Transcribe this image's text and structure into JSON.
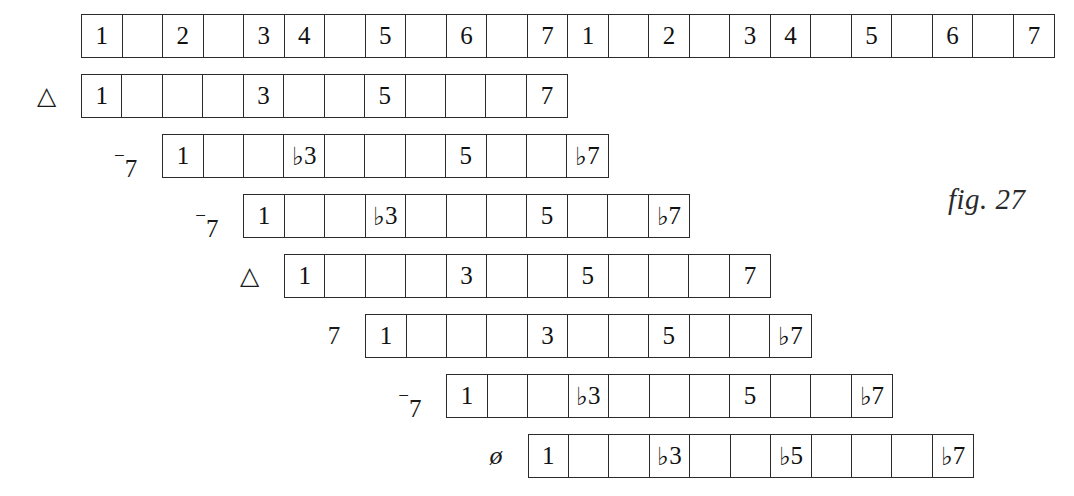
{
  "figure": {
    "caption": "fig. 27",
    "cell_width": 40.6,
    "row_height": 44,
    "origin_x": 81,
    "origin_y": 14,
    "row_pitch": 60
  },
  "chart_data": {
    "type": "table",
    "title": "fig. 27",
    "xlabel": "",
    "ylabel": "",
    "grid": true,
    "legend": "none",
    "cell_count_per_semitone": 1,
    "rows": [
      {
        "name": "chromatic-scale-two-octaves",
        "label": "",
        "label_kind": "none",
        "offset_semitones": 0,
        "cells": 24,
        "degrees": {
          "0": "1",
          "2": "2",
          "4": "3",
          "5": "4",
          "7": "5",
          "9": "6",
          "11": "7",
          "12": "1",
          "14": "2",
          "16": "3",
          "17": "4",
          "19": "5",
          "21": "6",
          "23": "7"
        }
      },
      {
        "name": "major-seventh-on-1",
        "label": "△",
        "label_kind": "triangle",
        "offset_semitones": 0,
        "cells": 12,
        "degrees": {
          "0": "1",
          "4": "3",
          "7": "5",
          "11": "7"
        }
      },
      {
        "name": "minor-seventh-on-2",
        "label": "-7",
        "label_kind": "minor-seven",
        "offset_semitones": 2,
        "cells": 11,
        "degrees": {
          "0": "1",
          "3": "♭3",
          "7": "5",
          "10": "♭7"
        }
      },
      {
        "name": "minor-seventh-on-3",
        "label": "-7",
        "label_kind": "minor-seven",
        "offset_semitones": 4,
        "cells": 11,
        "degrees": {
          "0": "1",
          "3": "♭3",
          "7": "5",
          "10": "♭7"
        }
      },
      {
        "name": "major-seventh-on-4",
        "label": "△",
        "label_kind": "triangle",
        "offset_semitones": 5,
        "cells": 12,
        "degrees": {
          "0": "1",
          "4": "3",
          "7": "5",
          "11": "7"
        }
      },
      {
        "name": "dominant-seventh-on-5",
        "label": "7",
        "label_kind": "dominant-seven",
        "offset_semitones": 7,
        "cells": 11,
        "degrees": {
          "0": "1",
          "4": "3",
          "7": "5",
          "10": "♭7"
        }
      },
      {
        "name": "minor-seventh-on-6",
        "label": "-7",
        "label_kind": "minor-seven",
        "offset_semitones": 9,
        "cells": 11,
        "degrees": {
          "0": "1",
          "3": "♭3",
          "7": "5",
          "10": "♭7"
        }
      },
      {
        "name": "half-diminished-seventh-on-7",
        "label": "ø",
        "label_kind": "half-diminished",
        "offset_semitones": 11,
        "cells": 11,
        "degrees": {
          "0": "1",
          "3": "♭3",
          "6": "♭5",
          "10": "♭7"
        }
      }
    ]
  }
}
